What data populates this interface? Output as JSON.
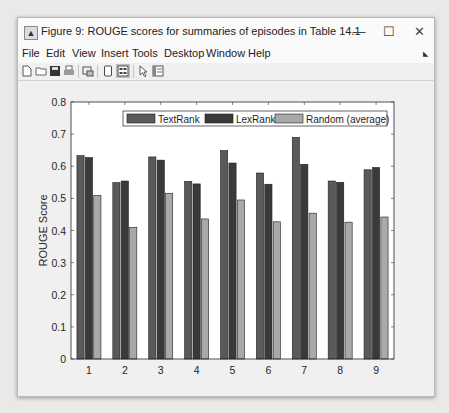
{
  "window": {
    "title": "Figure 9: ROUGE scores for summaries of episodes in Table 14.1",
    "minimize_glyph": "—",
    "maximize_glyph": "☐",
    "close_glyph": "✕"
  },
  "menubar": {
    "items": [
      "File",
      "Edit",
      "View",
      "Insert",
      "Tools",
      "Desktop",
      "Window",
      "Help"
    ]
  },
  "toolbar": {
    "icons": [
      "new-figure-icon",
      "open-file-icon",
      "save-icon",
      "print-icon",
      "link-plot-icon",
      "hide-plot-tools-icon",
      "show-plot-tools-icon",
      "edit-plot-arrow-icon",
      "open-property-inspector-icon"
    ]
  },
  "chart_data": {
    "type": "bar",
    "title": "",
    "xlabel": "",
    "ylabel": "ROUGE Score",
    "ylim": [
      0,
      0.8
    ],
    "yticks": [
      0,
      0.1,
      0.2,
      0.3,
      0.4,
      0.5,
      0.6,
      0.7,
      0.8
    ],
    "ytick_labels": [
      "0",
      "0.1",
      "0.2",
      "0.3",
      "0.4",
      "0.5",
      "0.6",
      "0.7",
      "0.8"
    ],
    "categories": [
      "1",
      "2",
      "3",
      "4",
      "5",
      "6",
      "7",
      "8",
      "9"
    ],
    "grid": false,
    "legend_position": "top-right (north-east, horizontal)",
    "series": [
      {
        "name": "TextRank",
        "color": "#5a5a5a",
        "values": [
          0.633,
          0.549,
          0.629,
          0.553,
          0.649,
          0.579,
          0.69,
          0.554,
          0.589
        ]
      },
      {
        "name": "LexRank",
        "color": "#3a3a3a",
        "values": [
          0.627,
          0.554,
          0.619,
          0.545,
          0.61,
          0.544,
          0.606,
          0.55,
          0.596
        ]
      },
      {
        "name": "Random (average)",
        "color": "#a9a9a9",
        "values": [
          0.509,
          0.41,
          0.516,
          0.436,
          0.495,
          0.427,
          0.454,
          0.426,
          0.442
        ]
      }
    ]
  }
}
